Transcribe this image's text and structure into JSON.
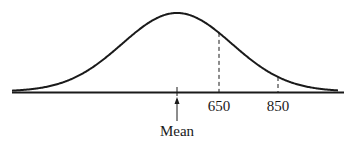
{
  "chart_data": {
    "type": "line",
    "title": "",
    "subtitle": "",
    "xlabel": "",
    "ylabel": "",
    "tick_labels": [
      "650",
      "850"
    ],
    "annotations": [
      {
        "text": "Mean",
        "arrow_to": "mean",
        "position": "below axis"
      }
    ],
    "markers": [
      {
        "label": "650",
        "style": "dashed vertical to curve"
      },
      {
        "label": "850",
        "style": "dashed vertical to curve"
      }
    ],
    "distribution": {
      "shape": "normal",
      "mean_approx": 508,
      "sd_approx": 186
    },
    "grid": false,
    "legend": null
  },
  "labels": {
    "tick_650": "650",
    "tick_850": "850",
    "mean": "Mean"
  }
}
